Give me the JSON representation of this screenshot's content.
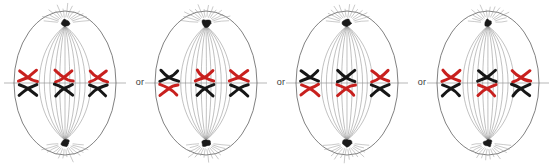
{
  "diagram": {
    "separator_label": "or",
    "colors": {
      "maternal_red": "#C8201E",
      "paternal_black": "#161616",
      "membrane_gray": "#6a6a6a",
      "spindle_gray": "#8c8c8c",
      "equator_gray": "#9a9a9a",
      "centrosome_black": "#1a1a1a",
      "background": "#ffffff"
    },
    "cell_geometry": {
      "cx": 65,
      "cy": 83,
      "rx": 51,
      "ry": 72,
      "top_pole_y": 23,
      "bottom_pole_y": 143,
      "spindle_fiber_count": 11,
      "aster_ray_count": 14,
      "equator_y": 83
    },
    "chromosome_shape": {
      "type": "replicated-x-shaped",
      "description": "two sister chromatids joined at a centromere, drawn as an X",
      "arm_length": 9,
      "stroke_width": 3
    },
    "cells": [
      {
        "index": 1,
        "label": "arrangement-1",
        "x_offset": 0,
        "pairs": [
          {
            "pair": 1,
            "x": 28,
            "top": "red",
            "bottom": "black"
          },
          {
            "pair": 2,
            "x": 64,
            "top": "red",
            "bottom": "black"
          },
          {
            "pair": 3,
            "x": 98,
            "top": "red",
            "bottom": "black"
          }
        ]
      },
      {
        "index": 2,
        "label": "arrangement-2",
        "x_offset": 141,
        "pairs": [
          {
            "pair": 1,
            "x": 28,
            "top": "black",
            "bottom": "red"
          },
          {
            "pair": 2,
            "x": 64,
            "top": "red",
            "bottom": "black"
          },
          {
            "pair": 3,
            "x": 98,
            "top": "red",
            "bottom": "black"
          }
        ]
      },
      {
        "index": 3,
        "label": "arrangement-3",
        "x_offset": 282,
        "pairs": [
          {
            "pair": 1,
            "x": 28,
            "top": "black",
            "bottom": "red"
          },
          {
            "pair": 2,
            "x": 64,
            "top": "black",
            "bottom": "red"
          },
          {
            "pair": 3,
            "x": 98,
            "top": "red",
            "bottom": "black"
          }
        ]
      },
      {
        "index": 4,
        "label": "arrangement-4",
        "x_offset": 423,
        "pairs": [
          {
            "pair": 1,
            "x": 28,
            "top": "red",
            "bottom": "black"
          },
          {
            "pair": 2,
            "x": 64,
            "top": "black",
            "bottom": "red"
          },
          {
            "pair": 3,
            "x": 98,
            "top": "red",
            "bottom": "black"
          }
        ]
      }
    ],
    "separators": [
      {
        "index": 1,
        "x": 131,
        "text": "or"
      },
      {
        "index": 2,
        "x": 272,
        "text": "or"
      },
      {
        "index": 3,
        "x": 413,
        "text": "or"
      }
    ]
  }
}
